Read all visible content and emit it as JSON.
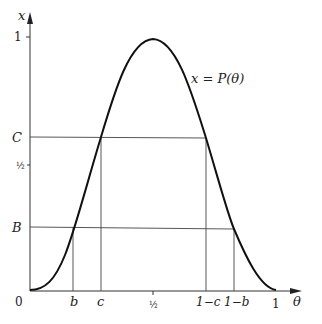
{
  "diagram": {
    "curve_label": "x = P(θ)",
    "y_axis": {
      "label": "x",
      "ticks": [
        {
          "label": "1",
          "y": 37
        },
        {
          "label": "C",
          "y": 137
        },
        {
          "label": "½",
          "y": 165
        },
        {
          "label": "B",
          "y": 227
        }
      ]
    },
    "x_axis": {
      "label": "θ",
      "origin_label": "0",
      "ticks": [
        {
          "label": "b",
          "x": 73
        },
        {
          "label": "c",
          "x": 101
        },
        {
          "label": "½",
          "x": 153
        },
        {
          "label": "1−c",
          "x": 206
        },
        {
          "label": "1−b",
          "x": 234
        },
        {
          "label": "1",
          "x": 275
        }
      ]
    },
    "stroke_color": "#222222"
  }
}
